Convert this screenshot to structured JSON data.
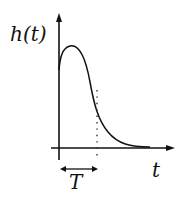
{
  "diagram": {
    "y_axis_label": "h(t)",
    "x_axis_label": "t",
    "interval_label": "T",
    "colors": {
      "curve": "#111111",
      "axes": "#111111",
      "dotted_marker": "#333333",
      "background": "#ffffff"
    },
    "elements": [
      "vertical axis with arrow (h(t))",
      "horizontal axis with arrow (t)",
      "curve rising sharply from origin to peak, then decaying to zero",
      "dotted vertical line at t = T",
      "double-headed arrow from 0 to T labeled T"
    ]
  }
}
